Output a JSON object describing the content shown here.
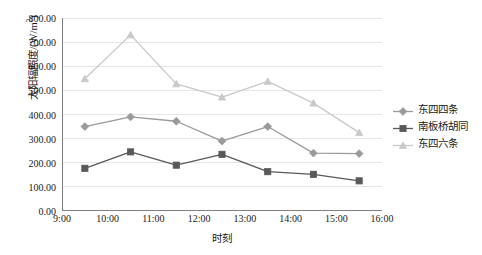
{
  "chart_data": {
    "type": "line",
    "title": "",
    "xlabel": "时刻",
    "ylabel": "太阳辐照度/(W/m2)",
    "ylabel_base": "太阳辐照度/(W/m",
    "ylabel_sup": "2",
    "ylabel_tail": ")",
    "x": [
      "9:30",
      "10:30",
      "11:30",
      "12:30",
      "13:30",
      "14:30",
      "15:30"
    ],
    "x_positions": [
      9.5,
      10.5,
      11.5,
      12.5,
      13.5,
      14.5,
      15.5
    ],
    "xlim": [
      9,
      16
    ],
    "ylim": [
      0,
      800
    ],
    "ytick_values": [
      0,
      100,
      200,
      300,
      400,
      500,
      600,
      700,
      800
    ],
    "ytick_labels": [
      "0.00",
      "100.00",
      "200.00",
      "300.00",
      "400.00",
      "500.00",
      "600.00",
      "700.00",
      "800.00"
    ],
    "xtick_values": [
      9,
      10,
      11,
      12,
      13,
      14,
      15,
      16
    ],
    "xtick_labels": [
      "9:00",
      "10:00",
      "11:00",
      "12:00",
      "13:00",
      "14:00",
      "15:00",
      "16:00"
    ],
    "grid": "horizontal",
    "legend_position": "right",
    "series": [
      {
        "name": "东四四条",
        "color": "#9a9a9a",
        "marker": "diamond",
        "values": [
          350,
          390,
          372,
          290,
          350,
          240,
          238
        ]
      },
      {
        "name": "南板桥胡同",
        "color": "#595959",
        "marker": "square",
        "values": [
          177,
          245,
          190,
          235,
          163,
          152,
          125
        ]
      },
      {
        "name": "东四六条",
        "color": "#c9c9c9",
        "marker": "triangle",
        "values": [
          548,
          730,
          527,
          472,
          537,
          447,
          325
        ]
      }
    ]
  },
  "legend": {
    "items": [
      {
        "label": "东四四条",
        "color": "#9a9a9a",
        "marker": "diamond"
      },
      {
        "label": "南板桥胡同",
        "color": "#595959",
        "marker": "square"
      },
      {
        "label": "东四六条",
        "color": "#c9c9c9",
        "marker": "triangle"
      }
    ]
  },
  "axes": {
    "frame_color": "#808080",
    "grid_color": "#e6e6e6"
  }
}
